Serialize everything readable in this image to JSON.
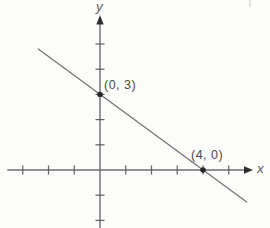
{
  "chart_data": {
    "type": "line",
    "title": "",
    "xlabel": "x",
    "ylabel": "y",
    "x_axis_range": [
      -3.6,
      5.9
    ],
    "y_axis_range": [
      -2.3,
      6.1
    ],
    "x_ticks": [
      -3,
      -2,
      -1,
      1,
      2,
      3,
      4,
      5
    ],
    "y_ticks": [
      -2,
      -1,
      1,
      2,
      3,
      4,
      5
    ],
    "grid": false,
    "legend": false,
    "series": [
      {
        "name": "line-through-intercepts",
        "x": [
          -2.41,
          5.71
        ],
        "y": [
          4.81,
          -1.28
        ]
      }
    ],
    "points": [
      {
        "x": 0,
        "y": 3,
        "label": "(0, 3)"
      },
      {
        "x": 4,
        "y": 0,
        "label": "(4, 0)"
      }
    ]
  },
  "colors": {
    "background": "#fcfcfa",
    "axis": "#6e6e6e",
    "line": "#757575",
    "tick": "#606060",
    "arrow": "#2e2e2e",
    "point": "#262626",
    "label_text": "#4a4a4a",
    "axis_letter_text": "#5e5e5e"
  }
}
